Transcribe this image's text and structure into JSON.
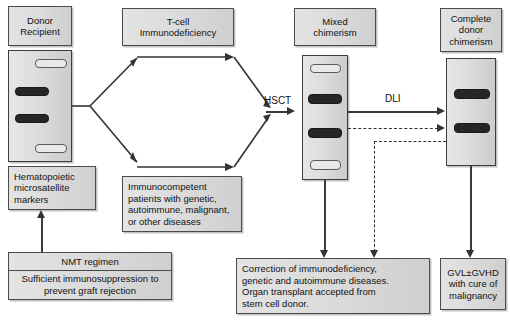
{
  "figure": {
    "type": "flow-diagram",
    "title_text": "",
    "nodes": {
      "donor_recipient": {
        "line1": "Donor",
        "line2": "Recipient"
      },
      "tcell": {
        "line1": "T-cell",
        "line2": "Immunodeficiency"
      },
      "immunocompetent": {
        "line1": "Immunocompetent",
        "line2": "patients with genetic,",
        "line3": "autoimmune, malignant,",
        "line4": "or other diseases"
      },
      "hematopoietic": {
        "line1": "Hematopoietic",
        "line2": "microsatellite",
        "line3": "markers"
      },
      "nmt": {
        "title": "NMT regimen",
        "line1": "Sufficient immunosuppression to",
        "line2": "prevent graft rejection"
      },
      "mixed": {
        "line1": "Mixed",
        "line2": "chimerism"
      },
      "complete": {
        "line1": "Complete",
        "line2": "donor",
        "line3": "chimerism"
      },
      "correction": {
        "line1": "Correction of immunodeficiency,",
        "line2": "genetic and autoimmune diseases.",
        "line3": "Organ transplant accepted from",
        "line4": "stem cell donor."
      },
      "gvl": {
        "line1": "GVL±GVHD",
        "line2": "with cure of",
        "line3": "malignancy"
      }
    },
    "edge_labels": {
      "hsct": "HSCT",
      "dli": "DLI"
    },
    "gels": {
      "patient_gel": {
        "name": "donor-recipient-gel",
        "bands": [
          "light",
          "dark",
          "dark",
          "light"
        ]
      },
      "mixed_gel": {
        "name": "mixed-chimerism-gel",
        "bands": [
          "light",
          "dark",
          "dark",
          "light"
        ]
      },
      "complete_gel": {
        "name": "complete-donor-chimerism-gel",
        "bands": [
          "dark",
          "dark"
        ]
      }
    },
    "colors": {
      "box_fill": "#dcdcdc",
      "box_border": "#4a4a4a",
      "band_dark": "#262626",
      "band_light": "#e9e9e9",
      "line": "#333333"
    }
  }
}
